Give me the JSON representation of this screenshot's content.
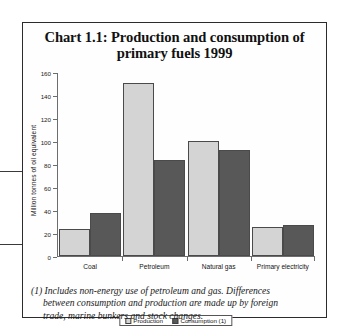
{
  "figure": {
    "title_line1": "Chart 1.1: Production and consumption of",
    "title_line2": "primary fuels 1999",
    "footnote_line1": "(1) Includes non-energy use of petroleum and gas. Differences",
    "footnote_line2": "between consumption and production are made up by foreign",
    "footnote_line3": "trade, marine bunkers and stock changes."
  },
  "colors": {
    "production": "#d4d4d4",
    "consumption": "#585858",
    "axis": "#6d6d6d",
    "border": "#2b2b2b"
  },
  "chart_data": {
    "type": "bar",
    "title": "Chart 1.1: Production and consumption of primary fuels 1999",
    "xlabel": "",
    "ylabel": "Million tonnes of oil equivalent",
    "ylim": [
      0,
      160
    ],
    "yticks": [
      0,
      20,
      40,
      60,
      80,
      100,
      120,
      140,
      160
    ],
    "ytick_labels": [
      "0",
      "20",
      "40",
      "60",
      "80",
      "100",
      "120",
      "140",
      "160"
    ],
    "grid": false,
    "legend_position": "bottom-center",
    "categories": [
      "Coal",
      "Petroleum",
      "Natural gas",
      "Primary electricity"
    ],
    "series": [
      {
        "name": "Production",
        "values": [
          23,
          150,
          100,
          25
        ]
      },
      {
        "name": "Consumption (1)",
        "values": [
          37,
          83,
          92,
          27
        ]
      }
    ]
  }
}
